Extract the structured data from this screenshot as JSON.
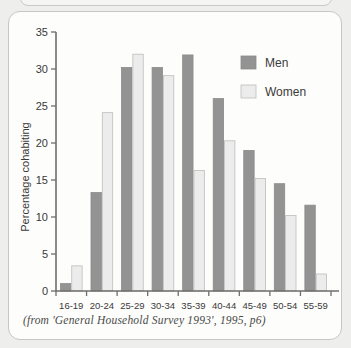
{
  "panel": {
    "caption": "(from 'General Household Survey 1993', 1995, p6)"
  },
  "legend": {
    "men_label": "Men",
    "women_label": "Women",
    "men_color": "#939393",
    "women_color": "#ececec"
  },
  "axis": {
    "y_title": "Percentage cohabiting",
    "y_ticks": [
      "0",
      "5",
      "10",
      "15",
      "20",
      "25",
      "30",
      "35"
    ],
    "x_ticks": [
      "16-19",
      "20-24",
      "25-29",
      "30-34",
      "35-39",
      "40-44",
      "45-49",
      "50-54",
      "55-59"
    ]
  },
  "chart_data": {
    "type": "bar",
    "title": "",
    "subtitle": "",
    "xlabel": "",
    "ylabel": "Percentage cohabiting",
    "ylim": [
      0,
      35
    ],
    "ytick_step": 5,
    "grid": false,
    "legend_position": "top-right",
    "categories": [
      "16-19",
      "20-24",
      "25-29",
      "30-34",
      "35-39",
      "40-44",
      "45-49",
      "50-54",
      "55-59"
    ],
    "series": [
      {
        "name": "Men",
        "color": "#939393",
        "values": [
          1.0,
          13.3,
          30.2,
          30.2,
          31.9,
          26.0,
          19.0,
          14.5,
          11.6
        ]
      },
      {
        "name": "Women",
        "color": "#ececec",
        "values": [
          3.4,
          24.1,
          32.0,
          29.1,
          16.3,
          20.3,
          15.2,
          10.2,
          2.3
        ]
      }
    ],
    "annotations": [
      "(from 'General Household Survey 1993', 1995, p6)"
    ]
  }
}
